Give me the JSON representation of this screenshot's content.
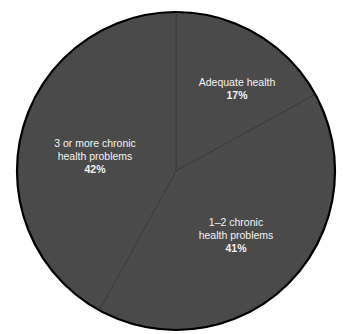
{
  "chart_data": {
    "type": "pie",
    "title": "",
    "categories": [
      "Adequate health",
      "1–2 chronic health problems",
      "3 or more chronic health problems"
    ],
    "values": [
      17,
      41,
      42
    ],
    "unit": "%",
    "start_angle": "12 o'clock",
    "direction": "clockwise",
    "legend": "none (direct labels on slices)",
    "slices": [
      {
        "label_lines": [
          "Adequate health"
        ],
        "value": 17,
        "value_label": "17%",
        "color": "#4a4a4a"
      },
      {
        "label_lines": [
          "1–2 chronic",
          "health problems"
        ],
        "value": 41,
        "value_label": "41%",
        "color": "#4a4a4a"
      },
      {
        "label_lines": [
          "3 or more chronic",
          "health problems"
        ],
        "value": 42,
        "value_label": "42%",
        "color": "#4a4a4a"
      }
    ]
  },
  "colors": {
    "background": "#ffffff",
    "slice_fill": "#4a4a4a",
    "outline": "#000000",
    "separator": "#383838",
    "label_text": "#f2f2f2"
  },
  "geometry": {
    "cx": 176,
    "cy": 171,
    "r": 159
  }
}
